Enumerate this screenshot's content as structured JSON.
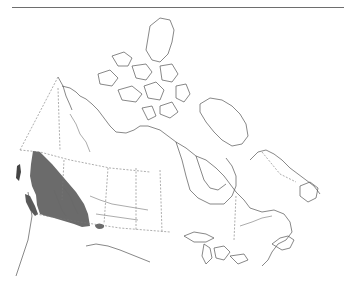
{
  "map": {
    "region": "Canada",
    "type": "species range map",
    "colors": {
      "background": "#ffffff",
      "outline": "#555555",
      "borders": "#777777",
      "range_fill": "#6b6b6b",
      "top_rule": "#6e6e6e"
    },
    "range": {
      "description": "Shaded distribution in British Columbia, with a small outlier patch in southern Alberta",
      "areas": [
        "british-columbia",
        "southern-alberta-outlier"
      ]
    }
  }
}
